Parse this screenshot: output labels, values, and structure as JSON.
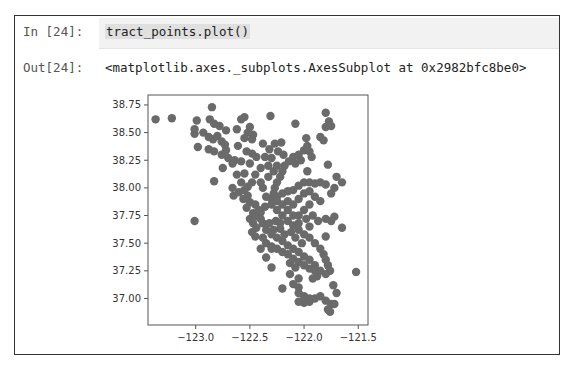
{
  "cell": {
    "in_prompt": "In [24]:",
    "code": "tract_points.plot()",
    "out_prompt": "Out[24]:",
    "output_text": "<matplotlib.axes._subplots.AxesSubplot at 0x2982bfc8be0>"
  },
  "colors": {
    "marker": "#6a6a6a",
    "axes": "#555555",
    "input_bg": "#f2f2f2"
  },
  "chart_data": {
    "type": "scatter",
    "title": "",
    "xlabel": "",
    "ylabel": "",
    "xlim": [
      -123.44,
      -121.41
    ],
    "ylim": [
      36.76,
      38.84
    ],
    "grid": false,
    "legend": "none",
    "xticks": [
      -123.0,
      -122.5,
      -122.0,
      -121.5
    ],
    "xtick_labels": [
      "−123.0",
      "−122.5",
      "−122.0",
      "−121.5"
    ],
    "yticks": [
      38.75,
      38.5,
      38.25,
      38.0,
      37.75,
      37.5,
      37.25,
      37.0
    ],
    "ytick_labels": [
      "38.75",
      "38.50",
      "38.25",
      "38.00",
      "37.75",
      "37.50",
      "37.25",
      "37.00"
    ],
    "series": [
      {
        "name": "tract_points",
        "points": [
          [
            -123.37,
            38.62
          ],
          [
            -123.22,
            38.63
          ],
          [
            -122.85,
            38.73
          ],
          [
            -122.99,
            38.61
          ],
          [
            -122.87,
            38.62
          ],
          [
            -122.83,
            38.58
          ],
          [
            -122.78,
            38.56
          ],
          [
            -122.72,
            38.52
          ],
          [
            -123.01,
            38.53
          ],
          [
            -123.01,
            38.49
          ],
          [
            -122.93,
            38.5
          ],
          [
            -122.88,
            38.46
          ],
          [
            -122.84,
            38.44
          ],
          [
            -122.8,
            38.47
          ],
          [
            -122.76,
            38.42
          ],
          [
            -122.73,
            38.39
          ],
          [
            -122.98,
            38.37
          ],
          [
            -122.88,
            38.35
          ],
          [
            -122.83,
            38.33
          ],
          [
            -122.76,
            38.3
          ],
          [
            -122.72,
            38.34
          ],
          [
            -122.7,
            38.27
          ],
          [
            -122.66,
            38.22
          ],
          [
            -122.64,
            38.25
          ],
          [
            -122.58,
            38.62
          ],
          [
            -122.55,
            38.64
          ],
          [
            -122.62,
            38.53
          ],
          [
            -122.5,
            38.55
          ],
          [
            -122.52,
            38.5
          ],
          [
            -122.47,
            38.48
          ],
          [
            -122.55,
            38.45
          ],
          [
            -122.48,
            38.44
          ],
          [
            -122.61,
            38.38
          ],
          [
            -122.53,
            38.33
          ],
          [
            -122.48,
            38.31
          ],
          [
            -122.44,
            38.28
          ],
          [
            -122.58,
            38.24
          ],
          [
            -122.5,
            38.22
          ],
          [
            -122.31,
            38.65
          ],
          [
            -122.08,
            38.58
          ],
          [
            -122.38,
            38.4
          ],
          [
            -122.32,
            38.35
          ],
          [
            -122.27,
            38.4
          ],
          [
            -122.21,
            38.41
          ],
          [
            -122.24,
            38.33
          ],
          [
            -122.19,
            38.3
          ],
          [
            -122.3,
            38.27
          ],
          [
            -122.36,
            38.28
          ],
          [
            -122.75,
            38.18
          ],
          [
            -122.83,
            38.06
          ],
          [
            -122.62,
            38.12
          ],
          [
            -122.55,
            38.13
          ],
          [
            -122.66,
            38.0
          ],
          [
            -122.65,
            37.93
          ],
          [
            -122.58,
            38.05
          ],
          [
            -122.55,
            37.98
          ],
          [
            -122.52,
            37.93
          ],
          [
            -122.5,
            37.87
          ],
          [
            -122.45,
            37.85
          ],
          [
            -122.42,
            37.8
          ],
          [
            -122.47,
            37.77
          ],
          [
            -122.5,
            37.72
          ],
          [
            -122.47,
            37.68
          ],
          [
            -122.44,
            37.64
          ],
          [
            -122.48,
            37.6
          ],
          [
            -122.45,
            37.56
          ],
          [
            -122.4,
            37.72
          ],
          [
            -122.38,
            37.68
          ],
          [
            -122.43,
            37.74
          ],
          [
            -122.4,
            37.78
          ],
          [
            -122.36,
            37.83
          ],
          [
            -122.3,
            37.9
          ],
          [
            -122.28,
            37.95
          ],
          [
            -122.27,
            38.0
          ],
          [
            -122.25,
            38.05
          ],
          [
            -122.22,
            38.1
          ],
          [
            -122.2,
            38.15
          ],
          [
            -122.18,
            38.2
          ],
          [
            -122.14,
            38.24
          ],
          [
            -122.1,
            38.28
          ],
          [
            -122.05,
            38.3
          ],
          [
            -122.0,
            38.34
          ],
          [
            -121.97,
            38.38
          ],
          [
            -121.95,
            38.33
          ],
          [
            -121.93,
            38.28
          ],
          [
            -122.03,
            38.25
          ],
          [
            -122.08,
            38.22
          ],
          [
            -121.98,
            38.45
          ],
          [
            -121.8,
            38.68
          ],
          [
            -121.77,
            38.6
          ],
          [
            -121.8,
            38.55
          ],
          [
            -121.75,
            38.56
          ],
          [
            -121.85,
            38.46
          ],
          [
            -121.82,
            38.43
          ],
          [
            -121.97,
            38.15
          ],
          [
            -121.78,
            38.21
          ],
          [
            -121.7,
            38.1
          ],
          [
            -121.65,
            38.05
          ],
          [
            -121.72,
            38.0
          ],
          [
            -121.75,
            37.95
          ],
          [
            -121.8,
            38.03
          ],
          [
            -121.85,
            38.05
          ],
          [
            -121.9,
            38.04
          ],
          [
            -121.95,
            38.05
          ],
          [
            -122.0,
            38.05
          ],
          [
            -122.05,
            38.02
          ],
          [
            -122.1,
            37.98
          ],
          [
            -122.15,
            37.97
          ],
          [
            -122.2,
            37.95
          ],
          [
            -122.25,
            37.92
          ],
          [
            -122.3,
            37.85
          ],
          [
            -122.25,
            37.8
          ],
          [
            -122.2,
            37.75
          ],
          [
            -122.15,
            37.7
          ],
          [
            -122.1,
            37.66
          ],
          [
            -122.05,
            37.62
          ],
          [
            -122.0,
            37.58
          ],
          [
            -121.95,
            37.55
          ],
          [
            -121.9,
            37.5
          ],
          [
            -121.85,
            37.45
          ],
          [
            -121.82,
            37.4
          ],
          [
            -121.8,
            37.35
          ],
          [
            -121.78,
            37.3
          ],
          [
            -121.76,
            37.25
          ],
          [
            -121.8,
            37.22
          ],
          [
            -121.85,
            37.25
          ],
          [
            -121.9,
            37.3
          ],
          [
            -121.95,
            37.35
          ],
          [
            -122.0,
            37.38
          ],
          [
            -122.05,
            37.42
          ],
          [
            -122.1,
            37.45
          ],
          [
            -122.15,
            37.48
          ],
          [
            -122.2,
            37.52
          ],
          [
            -122.25,
            37.55
          ],
          [
            -122.3,
            37.58
          ],
          [
            -122.35,
            37.62
          ],
          [
            -122.38,
            37.55
          ],
          [
            -122.35,
            37.5
          ],
          [
            -122.3,
            37.47
          ],
          [
            -122.25,
            37.45
          ],
          [
            -122.2,
            37.42
          ],
          [
            -122.15,
            37.4
          ],
          [
            -122.1,
            37.36
          ],
          [
            -122.05,
            37.33
          ],
          [
            -122.0,
            37.3
          ],
          [
            -121.95,
            37.27
          ],
          [
            -121.9,
            37.25
          ],
          [
            -121.88,
            37.2
          ],
          [
            -121.92,
            37.18
          ],
          [
            -122.15,
            37.8
          ],
          [
            -122.1,
            37.85
          ],
          [
            -122.05,
            37.9
          ],
          [
            -122.0,
            37.95
          ],
          [
            -121.95,
            37.97
          ],
          [
            -121.9,
            37.92
          ],
          [
            -121.85,
            37.88
          ],
          [
            -121.95,
            37.85
          ],
          [
            -122.0,
            37.8
          ],
          [
            -122.05,
            37.75
          ],
          [
            -121.98,
            37.72
          ],
          [
            -121.92,
            37.75
          ],
          [
            -121.87,
            37.7
          ],
          [
            -121.8,
            37.72
          ],
          [
            -121.75,
            37.7
          ],
          [
            -121.72,
            37.74
          ],
          [
            -121.65,
            37.64
          ],
          [
            -121.8,
            37.56
          ],
          [
            -121.95,
            37.65
          ],
          [
            -122.05,
            37.68
          ],
          [
            -122.12,
            37.6
          ],
          [
            -122.08,
            37.55
          ],
          [
            -122.02,
            37.5
          ],
          [
            -122.3,
            37.45
          ],
          [
            -122.4,
            37.45
          ],
          [
            -122.35,
            37.37
          ],
          [
            -122.3,
            37.28
          ],
          [
            -122.13,
            37.22
          ],
          [
            -122.05,
            37.18
          ],
          [
            -122.2,
            37.09
          ],
          [
            -122.1,
            37.13
          ],
          [
            -122.05,
            37.1
          ],
          [
            -122.05,
            37.05
          ],
          [
            -122.0,
            37.02
          ],
          [
            -121.95,
            37.0
          ],
          [
            -122.05,
            36.97
          ],
          [
            -122.0,
            36.96
          ],
          [
            -121.95,
            36.97
          ],
          [
            -121.9,
            37.0
          ],
          [
            -121.85,
            37.02
          ],
          [
            -121.8,
            36.98
          ],
          [
            -121.75,
            36.95
          ],
          [
            -121.78,
            36.9
          ],
          [
            -121.76,
            36.88
          ],
          [
            -121.72,
            36.95
          ],
          [
            -121.7,
            37.05
          ],
          [
            -121.73,
            37.12
          ],
          [
            -121.52,
            37.24
          ],
          [
            -123.01,
            37.7
          ],
          [
            -122.13,
            37.32
          ],
          [
            -122.08,
            37.28
          ],
          [
            -122.22,
            37.63
          ],
          [
            -122.18,
            37.58
          ],
          [
            -122.28,
            37.62
          ],
          [
            -122.32,
            37.68
          ],
          [
            -122.26,
            37.7
          ],
          [
            -122.22,
            37.68
          ],
          [
            -122.1,
            37.75
          ],
          [
            -122.15,
            37.88
          ],
          [
            -122.2,
            37.85
          ],
          [
            -122.25,
            37.88
          ],
          [
            -122.35,
            37.92
          ],
          [
            -122.38,
            38.0
          ],
          [
            -122.4,
            38.05
          ],
          [
            -122.33,
            38.1
          ],
          [
            -122.28,
            38.15
          ],
          [
            -122.25,
            38.2
          ],
          [
            -122.33,
            38.2
          ],
          [
            -122.4,
            38.18
          ],
          [
            -122.45,
            38.12
          ],
          [
            -122.48,
            38.05
          ],
          [
            -122.52,
            38.01
          ],
          [
            -122.6,
            37.96
          ],
          [
            -122.56,
            37.9
          ],
          [
            -122.53,
            37.82
          ]
        ]
      }
    ]
  }
}
